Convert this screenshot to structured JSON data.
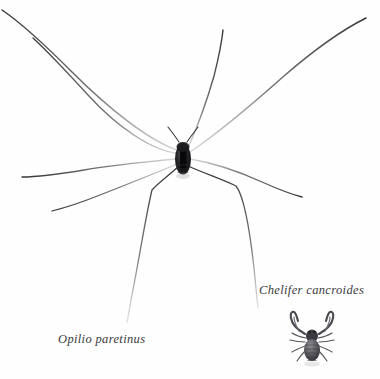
{
  "plate": {
    "background_color": "#fefefe",
    "width": 380,
    "height": 379,
    "ink_color": "#4a4a4c",
    "body_color": "#1a1a1a"
  },
  "specimens": [
    {
      "id": "opilio",
      "common_name": "harvestman",
      "scientific_name": "Opilio paretinus",
      "caption": "Opilio paretinus",
      "caption_style": "italic",
      "leg_count": 8,
      "body_center": [
        183,
        158
      ],
      "body_size": [
        15,
        30
      ]
    },
    {
      "id": "chelifer",
      "common_name": "book scorpion",
      "scientific_name": "Chelifer cancroides",
      "caption": "Chelifer cancroides",
      "caption_style": "italic",
      "leg_count": 8,
      "pedipalp_count": 2,
      "body_center": [
        312,
        343
      ],
      "body_size": [
        16,
        22
      ]
    }
  ],
  "icons": {
    "harvestman": "harvestman-figure",
    "pseudoscorpion": "pseudoscorpion-figure"
  }
}
